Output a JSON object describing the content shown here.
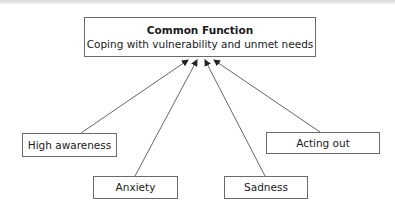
{
  "diagram": {
    "central": {
      "title": "Common Function",
      "subtitle": "Coping with vulnerability and unmet needs"
    },
    "nodes": [
      {
        "id": "high-awareness",
        "label": "High awareness"
      },
      {
        "id": "anxiety",
        "label": "Anxiety"
      },
      {
        "id": "sadness",
        "label": "Sadness"
      },
      {
        "id": "acting-out",
        "label": "Acting out"
      }
    ],
    "edges": [
      {
        "from": "high-awareness",
        "to": "central"
      },
      {
        "from": "anxiety",
        "to": "central"
      },
      {
        "from": "sadness",
        "to": "central"
      },
      {
        "from": "acting-out",
        "to": "central"
      }
    ],
    "colors": {
      "border": "#6a6a6a",
      "line": "#555555",
      "text": "#1a1a1a"
    }
  }
}
